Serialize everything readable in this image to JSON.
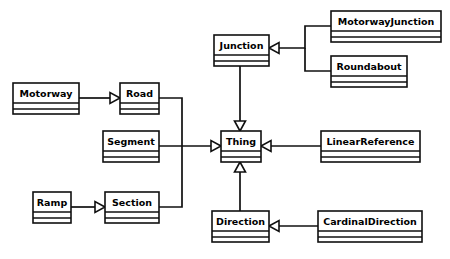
{
  "diagram": {
    "type": "uml-class-diagram",
    "background_color": "#ffffff",
    "line_color": "#101010",
    "classes": [
      {
        "id": "motorway",
        "name": "Motorway",
        "x": 13,
        "y": 83,
        "w": 66,
        "h": 31
      },
      {
        "id": "road",
        "name": "Road",
        "x": 120,
        "y": 83,
        "w": 39,
        "h": 31
      },
      {
        "id": "segment",
        "name": "Segment",
        "x": 103,
        "y": 131,
        "w": 56,
        "h": 31
      },
      {
        "id": "ramp",
        "name": "Ramp",
        "x": 33,
        "y": 192,
        "w": 38,
        "h": 31
      },
      {
        "id": "section",
        "name": "Section",
        "x": 105,
        "y": 192,
        "w": 54,
        "h": 31
      },
      {
        "id": "junction",
        "name": "Junction",
        "x": 214,
        "y": 35,
        "w": 55,
        "h": 31
      },
      {
        "id": "motorwayjunction",
        "name": "MotorwayJunction",
        "x": 331,
        "y": 11,
        "w": 110,
        "h": 31
      },
      {
        "id": "roundabout",
        "name": "Roundabout",
        "x": 331,
        "y": 56,
        "w": 76,
        "h": 31
      },
      {
        "id": "thing",
        "name": "Thing",
        "x": 221,
        "y": 131,
        "w": 40,
        "h": 31
      },
      {
        "id": "linearreference",
        "name": "LinearReference",
        "x": 321,
        "y": 131,
        "w": 99,
        "h": 31
      },
      {
        "id": "direction",
        "name": "Direction",
        "x": 212,
        "y": 211,
        "w": 57,
        "h": 31
      },
      {
        "id": "cardinaldirection",
        "name": "CardinalDirection",
        "x": 318,
        "y": 211,
        "w": 104,
        "h": 31
      }
    ],
    "relationships": [
      {
        "id": "motorway-road",
        "type": "generalization",
        "from": "Motorway",
        "to": "Road"
      },
      {
        "id": "ramp-section",
        "type": "generalization",
        "from": "Ramp",
        "to": "Section"
      },
      {
        "id": "road-thing",
        "type": "generalization",
        "from": "Road",
        "to": "Thing"
      },
      {
        "id": "segment-thing",
        "type": "generalization",
        "from": "Segment",
        "to": "Thing"
      },
      {
        "id": "section-thing",
        "type": "generalization",
        "from": "Section",
        "to": "Thing"
      },
      {
        "id": "junction-thing",
        "type": "generalization",
        "from": "Junction",
        "to": "Thing"
      },
      {
        "id": "direction-thing",
        "type": "generalization",
        "from": "Direction",
        "to": "Thing"
      },
      {
        "id": "linearreference-thing",
        "type": "generalization",
        "from": "LinearReference",
        "to": "Thing"
      },
      {
        "id": "motorwayjunction-junction",
        "type": "generalization",
        "from": "MotorwayJunction",
        "to": "Junction"
      },
      {
        "id": "roundabout-junction",
        "type": "generalization",
        "from": "Roundabout",
        "to": "Junction"
      },
      {
        "id": "cardinaldirection-direction",
        "type": "generalization",
        "from": "CardinalDirection",
        "to": "Direction"
      }
    ]
  }
}
